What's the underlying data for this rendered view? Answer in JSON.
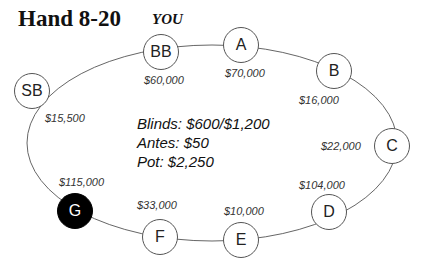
{
  "title": "Hand 8-20",
  "hero_label": "YOU",
  "info": {
    "blinds": "Blinds: $600/$1,200",
    "antes": "Antes: $50",
    "pot": "Pot: $2,250"
  },
  "seats": [
    {
      "label": "BB",
      "stack": "$60,000"
    },
    {
      "label": "A",
      "stack": "$70,000"
    },
    {
      "label": "B",
      "stack": "$16,000"
    },
    {
      "label": "C",
      "stack": "$22,000"
    },
    {
      "label": "D",
      "stack": "$104,000"
    },
    {
      "label": "E",
      "stack": "$10,000"
    },
    {
      "label": "F",
      "stack": "$33,000"
    },
    {
      "label": "G",
      "stack": "$115,000",
      "hero": true
    },
    {
      "label": "SB",
      "stack": "$15,500"
    }
  ]
}
